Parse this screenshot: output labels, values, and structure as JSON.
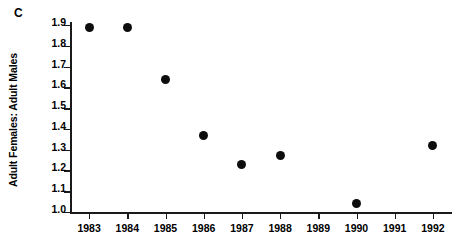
{
  "panel": {
    "label": "C"
  },
  "chart_data": {
    "type": "scatter",
    "title": "",
    "subtitle": "",
    "xlabel": "",
    "ylabel": "Adult Females: Adult Males",
    "xlim": [
      1982.5,
      1992.5
    ],
    "ylim": [
      1.0,
      1.9
    ],
    "grid": false,
    "legend": false,
    "legend_position": "none",
    "x_tick_labels": [
      "1983",
      "1984",
      "1985",
      "1986",
      "1987",
      "1988",
      "1989",
      "1990",
      "1991",
      "1992"
    ],
    "x_ticks": [
      1983,
      1984,
      1985,
      1986,
      1987,
      1988,
      1989,
      1990,
      1991,
      1992
    ],
    "y_tick_labels": [
      "1.9",
      "1.8",
      "1.7",
      "1.6",
      "1.5",
      "1.4",
      "1.3",
      "1.2",
      "1.1",
      "1.0"
    ],
    "y_ticks": [
      1.9,
      1.8,
      1.7,
      1.6,
      1.5,
      1.4,
      1.3,
      1.2,
      1.1,
      1.0
    ],
    "marker": "filled-circle",
    "marker_color": "#0d0d0d",
    "points": [
      {
        "x": 1983,
        "y": 1.89
      },
      {
        "x": 1984,
        "y": 1.89
      },
      {
        "x": 1985,
        "y": 1.64
      },
      {
        "x": 1986,
        "y": 1.37
      },
      {
        "x": 1987,
        "y": 1.23
      },
      {
        "x": 1988,
        "y": 1.27
      },
      {
        "x": 1990,
        "y": 1.04
      },
      {
        "x": 1992,
        "y": 1.32
      }
    ],
    "x": [
      1983,
      1984,
      1985,
      1986,
      1987,
      1988,
      1990,
      1992
    ],
    "values": [
      1.89,
      1.89,
      1.64,
      1.37,
      1.23,
      1.27,
      1.04,
      1.32
    ],
    "missing_x": [
      1989,
      1991
    ],
    "annotations": []
  }
}
